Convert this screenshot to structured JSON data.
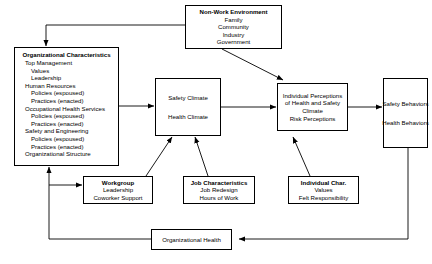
{
  "diagram": {
    "nodes": {
      "non_work": {
        "title": "Non-Work Environment",
        "items": [
          "Family",
          "Community",
          "Industry",
          "Government"
        ]
      },
      "org_char": {
        "title": "Organizational Characteristics",
        "items": [
          {
            "text": "Top Management",
            "level": 1
          },
          {
            "text": "Values",
            "level": 2
          },
          {
            "text": "Leadership",
            "level": 2
          },
          {
            "text": "Human Resources",
            "level": 1
          },
          {
            "text": "Policies (espoused)",
            "level": 2
          },
          {
            "text": "Practices (enacted)",
            "level": 2
          },
          {
            "text": "Occupational Health Services",
            "level": 1
          },
          {
            "text": "Policies (espoused)",
            "level": 2
          },
          {
            "text": "Practices (enacted)",
            "level": 2
          },
          {
            "text": "Safety and Engineering",
            "level": 1
          },
          {
            "text": "Policies (espoused)",
            "level": 2
          },
          {
            "text": "Practices (enacted)",
            "level": 2
          },
          {
            "text": "Organizational Structure",
            "level": 1
          }
        ]
      },
      "climate": {
        "line1": "Safety Climate",
        "line2": "Health Climate"
      },
      "perceptions": {
        "line1": "Individual Perceptions",
        "line2": "of Health and Safety",
        "line3": "Climate",
        "line4": "Risk Perceptions"
      },
      "behaviors": {
        "line1": "Safety Behaviors",
        "line2": "Health Behaviors"
      },
      "workgroup": {
        "title": "Workgroup",
        "items": [
          "Leadership",
          "Coworker Support"
        ]
      },
      "job_char": {
        "title": "Job Characteristics",
        "items": [
          "Job Redesign",
          "Hours of Work"
        ]
      },
      "individual_char": {
        "title": "Individual Char.",
        "items": [
          "Values",
          "Felt Responsibility"
        ]
      },
      "org_health": {
        "title": "Organizational Health"
      }
    },
    "colors": {
      "line": "#000000",
      "box_border": "#000000",
      "background": "#ffffff",
      "text": "#000000"
    }
  }
}
